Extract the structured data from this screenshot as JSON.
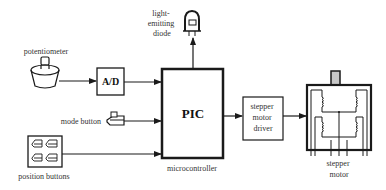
{
  "diagram": {
    "type": "block-diagram",
    "title": "",
    "colors": {
      "line": "#1a1a1a",
      "text": "#333333",
      "shaft": "#c8c8c8",
      "background": "#ffffff"
    },
    "components": {
      "led": {
        "label_lines": [
          "light-",
          "emitting",
          "diode"
        ]
      },
      "potentiometer": {
        "label": "potentiometer"
      },
      "adc": {
        "label": "A/D"
      },
      "mode_button": {
        "label": "mode button"
      },
      "position_buttons": {
        "label": "position buttons",
        "count": 4
      },
      "pic": {
        "label": "PIC",
        "caption": "microcontroller"
      },
      "driver": {
        "label_lines": [
          "stepper",
          "motor",
          "driver"
        ]
      },
      "motor": {
        "label_lines": [
          "stepper",
          "motor"
        ]
      }
    },
    "connections": [
      {
        "from": "potentiometer",
        "to": "A/D"
      },
      {
        "from": "A/D",
        "to": "PIC"
      },
      {
        "from": "mode button",
        "to": "PIC"
      },
      {
        "from": "position buttons",
        "to": "PIC"
      },
      {
        "from": "PIC",
        "to": "light-emitting diode"
      },
      {
        "from": "PIC",
        "to": "stepper motor driver"
      },
      {
        "from": "stepper motor driver",
        "to": "stepper motor"
      }
    ]
  }
}
